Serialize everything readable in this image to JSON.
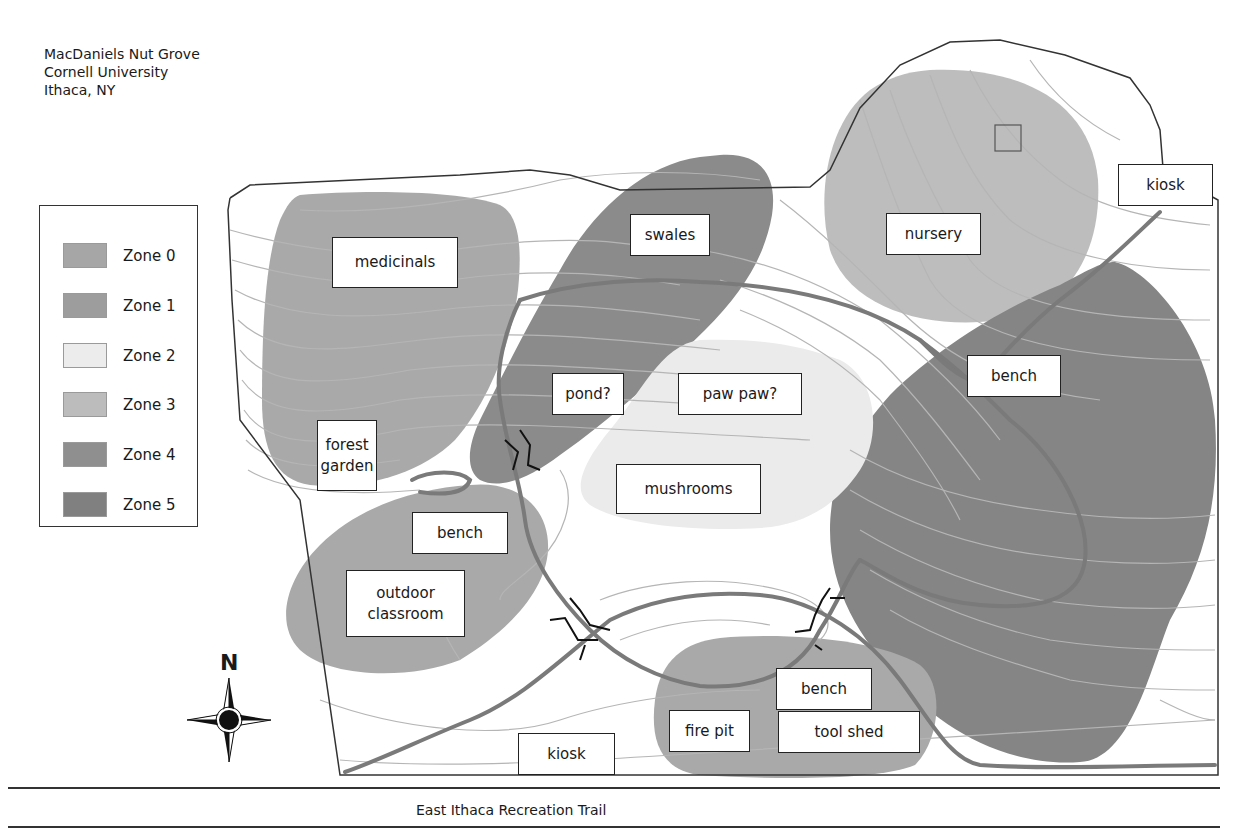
{
  "title": {
    "line1": "MacDaniels Nut Grove",
    "line2": "Cornell University",
    "line3": "Ithaca, NY"
  },
  "legend": {
    "items": [
      {
        "label": "Zone 0",
        "color": "#a6a6a6"
      },
      {
        "label": "Zone 1",
        "color": "#9d9d9d"
      },
      {
        "label": "Zone 2",
        "color": "#ececec"
      },
      {
        "label": "Zone 3",
        "color": "#bcbcbc"
      },
      {
        "label": "Zone 4",
        "color": "#8f8f8f"
      },
      {
        "label": "Zone 5",
        "color": "#808080"
      }
    ]
  },
  "zone_colors": {
    "zone0": "#a9a9a9",
    "zone1": "#9f9f9f",
    "zone2": "#ebebeb",
    "zone3": "#bdbdbd",
    "zone4": "#8b8b8b",
    "zone5": "#858585",
    "path": "#7a7a7a",
    "contour": "#b8b8b8",
    "boundary": "#333333"
  },
  "labels": {
    "medicinals": "medicinals",
    "swales": "swales",
    "nursery": "nursery",
    "kiosk_top": "kiosk",
    "pond": "pond?",
    "paw_paw": "paw paw?",
    "bench_east": "bench",
    "forest_garden": "forest\ngarden",
    "mushrooms": "mushrooms",
    "bench_west": "bench",
    "outdoor_classroom": "outdoor\nclassroom",
    "bench_south": "bench",
    "fire_pit": "fire pit",
    "tool_shed": "tool shed",
    "kiosk_bottom": "kiosk"
  },
  "compass": {
    "north_label": "N"
  },
  "trail": {
    "name": "East Ithaca Recreation Trail"
  }
}
